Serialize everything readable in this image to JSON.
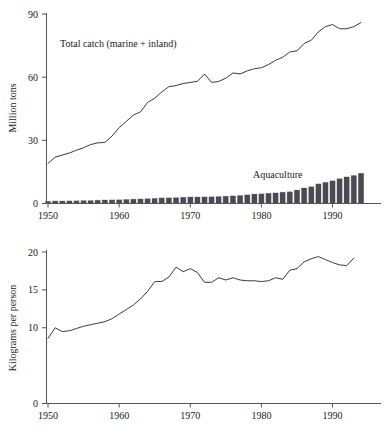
{
  "figure": {
    "background": "#ffffff",
    "ink": "#1a1a1a",
    "line_color": "#3a3a40",
    "bar_color": "#4a4a50",
    "axis_color": "#55525a"
  },
  "chart_data": [
    {
      "id": "top-panel",
      "type": "line",
      "title": "",
      "xlabel": "",
      "ylabel": "Million tons",
      "xlim": [
        1950,
        1994
      ],
      "ylim": [
        0,
        90
      ],
      "yticks": [
        0,
        30,
        60,
        90
      ],
      "xticks": [
        1950,
        1960,
        1970,
        1980,
        1990
      ],
      "grid": false,
      "legend_position": "inline-annotation",
      "annotations": [
        {
          "text": "Total catch (marine + inland)",
          "x": 1954,
          "y": 78
        },
        {
          "text": "Aquaculture",
          "x": 1981,
          "y": 19
        }
      ],
      "series": [
        {
          "name": "Total catch (marine + inland)",
          "kind": "line",
          "x": [
            1950,
            1951,
            1952,
            1953,
            1954,
            1955,
            1956,
            1957,
            1958,
            1959,
            1960,
            1961,
            1962,
            1963,
            1964,
            1965,
            1966,
            1967,
            1968,
            1969,
            1970,
            1971,
            1972,
            1973,
            1974,
            1975,
            1976,
            1977,
            1978,
            1979,
            1980,
            1981,
            1982,
            1983,
            1984,
            1985,
            1986,
            1987,
            1988,
            1989,
            1990,
            1991,
            1992,
            1993,
            1994
          ],
          "values": [
            19.0,
            22.0,
            23.0,
            24.0,
            25.3,
            26.5,
            28.0,
            28.8,
            29.0,
            32.0,
            36.0,
            39.0,
            42.0,
            43.5,
            48.0,
            50.0,
            53.0,
            55.5,
            56.0,
            57.0,
            57.5,
            58.0,
            61.5,
            57.5,
            58.0,
            59.5,
            62.0,
            61.5,
            63.0,
            64.0,
            64.5,
            66.0,
            68.0,
            69.5,
            72.0,
            72.5,
            76.0,
            77.5,
            81.5,
            84.0,
            85.0,
            83.0,
            83.0,
            84.0,
            86.0
          ]
        },
        {
          "name": "Aquaculture",
          "kind": "bar",
          "x": [
            1950,
            1951,
            1952,
            1953,
            1954,
            1955,
            1956,
            1957,
            1958,
            1959,
            1960,
            1961,
            1962,
            1963,
            1964,
            1965,
            1966,
            1967,
            1968,
            1969,
            1970,
            1971,
            1972,
            1973,
            1974,
            1975,
            1976,
            1977,
            1978,
            1979,
            1980,
            1981,
            1982,
            1983,
            1984,
            1985,
            1986,
            1987,
            1988,
            1989,
            1990,
            1991,
            1992,
            1993,
            1994
          ],
          "values": [
            1.2,
            1.3,
            1.3,
            1.4,
            1.5,
            1.6,
            1.6,
            1.7,
            1.8,
            1.9,
            2.0,
            2.1,
            2.2,
            2.3,
            2.5,
            2.6,
            2.8,
            2.9,
            3.0,
            3.1,
            3.2,
            3.2,
            3.3,
            3.4,
            3.5,
            3.6,
            3.8,
            4.0,
            4.3,
            4.6,
            4.8,
            5.0,
            5.2,
            5.5,
            5.8,
            6.5,
            7.5,
            8.2,
            9.5,
            10.2,
            11.0,
            12.0,
            12.8,
            13.5,
            14.5
          ]
        }
      ]
    },
    {
      "id": "bottom-panel",
      "type": "line",
      "title": "",
      "xlabel": "",
      "ylabel": "Kilograms per person",
      "xlim": [
        1950,
        1994
      ],
      "ylim": [
        0,
        20
      ],
      "yticks": [
        0,
        10,
        15,
        20
      ],
      "xticks": [
        1950,
        1960,
        1970,
        1980,
        1990
      ],
      "grid": false,
      "legend_position": "none",
      "annotations": [],
      "series": [
        {
          "name": "Kilograms per person",
          "kind": "line",
          "x": [
            1950,
            1951,
            1952,
            1953,
            1954,
            1955,
            1956,
            1957,
            1958,
            1959,
            1960,
            1961,
            1962,
            1963,
            1964,
            1965,
            1966,
            1967,
            1968,
            1969,
            1970,
            1971,
            1972,
            1973,
            1974,
            1975,
            1976,
            1977,
            1978,
            1979,
            1980,
            1981,
            1982,
            1983,
            1984,
            1985,
            1986,
            1987,
            1988,
            1989,
            1990,
            1991,
            1992,
            1993
          ],
          "values": [
            8.6,
            10.0,
            9.5,
            9.6,
            9.9,
            10.2,
            10.4,
            10.6,
            10.8,
            11.2,
            11.8,
            12.4,
            13.0,
            13.8,
            14.8,
            16.1,
            16.1,
            16.7,
            18.0,
            17.4,
            17.8,
            17.3,
            16.0,
            16.0,
            16.6,
            16.3,
            16.6,
            16.3,
            16.2,
            16.2,
            16.1,
            16.2,
            16.6,
            16.4,
            17.6,
            17.8,
            18.7,
            19.1,
            19.4,
            19.0,
            18.6,
            18.3,
            18.2,
            19.2
          ]
        }
      ]
    }
  ],
  "labels": {
    "top_y_title": "Million tons",
    "bottom_y_title": "Kilograms per person",
    "annotation_total_catch": "Total catch (marine + inland)",
    "annotation_aquaculture": "Aquaculture",
    "top_yticks": [
      "0",
      "30",
      "60",
      "90"
    ],
    "bottom_yticks": [
      "0",
      "10",
      "15",
      "20"
    ],
    "xticks": [
      "1950",
      "1960",
      "1970",
      "1980",
      "1990"
    ]
  }
}
